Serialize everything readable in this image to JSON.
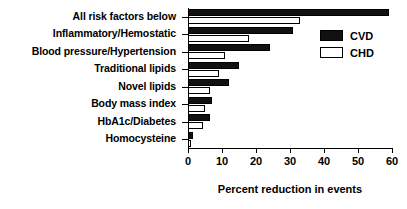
{
  "chart_data": {
    "type": "bar",
    "orientation": "horizontal",
    "title": "",
    "xlabel": "Percent reduction in events",
    "ylabel": "",
    "xlim": [
      0,
      60
    ],
    "xticks": [
      0,
      10,
      20,
      30,
      40,
      50,
      60
    ],
    "grid": false,
    "legend_position": "top-right",
    "categories": [
      "All risk factors below",
      "Inflammatory/Hemostatic",
      "Blood pressure/Hypertension",
      "Traditional lipids",
      "Novel lipids",
      "Body mass index",
      "HbA1c/Diabetes",
      "Homocysteine"
    ],
    "series": [
      {
        "name": "CVD",
        "color": "#111111",
        "values": [
          59,
          31,
          24,
          15,
          12,
          7,
          6.5,
          1.5
        ]
      },
      {
        "name": "CHD",
        "color": "#ffffff",
        "values": [
          33,
          18,
          11,
          9,
          6.5,
          5,
          4.5,
          1
        ]
      }
    ]
  },
  "legend": {
    "items": [
      {
        "label": "CVD",
        "style": "filled"
      },
      {
        "label": "CHD",
        "style": "open"
      }
    ]
  }
}
